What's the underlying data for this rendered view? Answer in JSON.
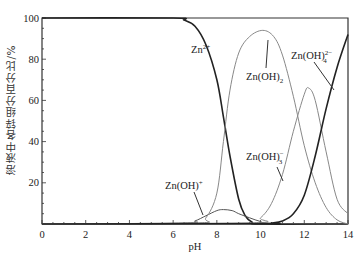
{
  "chart_data": {
    "type": "line",
    "title": "",
    "xlabel": "pH",
    "ylabel": "溶液中各锌组分百分比/%",
    "xlim": [
      0,
      14
    ],
    "ylim": [
      0,
      100
    ],
    "x_ticks": [
      0,
      2,
      4,
      6,
      8,
      10,
      12,
      14
    ],
    "y_ticks": [
      20,
      40,
      60,
      80,
      100
    ],
    "grid": false,
    "legend": "inline labels",
    "series": [
      {
        "name": "Zn2+",
        "label": "Zn²⁺",
        "color": "#222222",
        "x": [
          0,
          6.0,
          6.5,
          7.0,
          7.5,
          8.0,
          8.3,
          8.6,
          9.0,
          9.3,
          9.6,
          10.0,
          14
        ],
        "y": [
          100,
          100,
          99,
          96,
          87,
          70,
          52,
          33,
          12,
          4,
          1,
          0,
          0
        ]
      },
      {
        "name": "Zn(OH)+",
        "label": "Zn(OH)⁺",
        "color": "#555555",
        "x": [
          0,
          6.5,
          7.0,
          7.5,
          8.0,
          8.3,
          8.7,
          9.0,
          9.5,
          10.0,
          10.5,
          14
        ],
        "y": [
          0,
          0.5,
          1.5,
          4,
          6.5,
          7,
          6.5,
          5,
          3,
          1.2,
          0.3,
          0
        ]
      },
      {
        "name": "Zn(OH)2",
        "label": "Zn(OH)₂",
        "color": "#888888",
        "x": [
          0,
          7.0,
          7.5,
          8.0,
          8.3,
          8.6,
          9.0,
          9.5,
          10.1,
          10.6,
          11.0,
          11.5,
          12.0,
          12.5,
          13.0,
          13.5,
          14
        ],
        "y": [
          0,
          0.5,
          3,
          15,
          40,
          65,
          83,
          91,
          94,
          91,
          82,
          62,
          38,
          20,
          8,
          2,
          0
        ]
      },
      {
        "name": "Zn(OH)3-",
        "label": "Zn(OH)₃⁻",
        "color": "#888888",
        "x": [
          0,
          9.5,
          10.0,
          10.5,
          11.0,
          11.5,
          12.0,
          12.2,
          12.5,
          13.0,
          13.5,
          14
        ],
        "y": [
          0,
          0.5,
          3,
          10,
          24,
          45,
          63,
          66,
          60,
          35,
          12,
          5
        ]
      },
      {
        "name": "Zn(OH)4 2-",
        "label": "Zn(OH)₄²⁻",
        "color": "#222222",
        "x": [
          0,
          10.0,
          10.5,
          11.0,
          11.5,
          12.0,
          12.5,
          13.0,
          13.5,
          14
        ],
        "y": [
          0,
          0.2,
          0.5,
          1.5,
          5,
          14,
          33,
          56,
          76,
          92
        ]
      }
    ],
    "annotations": [
      {
        "text": "Zn²⁺",
        "base": "Zn",
        "sup": "2+",
        "sub": ""
      },
      {
        "text": "Zn(OH)₂",
        "base": "Zn(OH)",
        "sup": "",
        "sub": "2"
      },
      {
        "text": "Zn(OH)₄²⁻",
        "base": "Zn(OH)",
        "sup": "2−",
        "sub": "4"
      },
      {
        "text": "Zn(OH)⁺",
        "base": "Zn(OH)",
        "sup": "+",
        "sub": ""
      },
      {
        "text": "Zn(OH)₃⁻",
        "base": "Zn(OH)",
        "sup": "−",
        "sub": "3"
      }
    ]
  }
}
